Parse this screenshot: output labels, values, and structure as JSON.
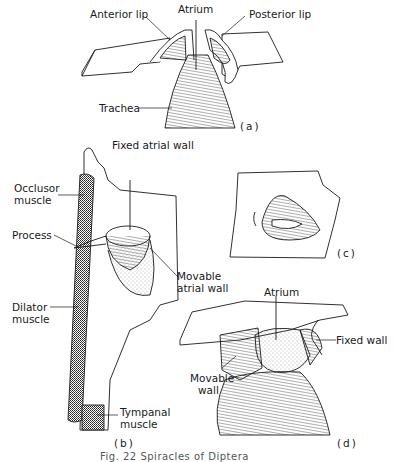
{
  "figure": {
    "caption": "Fig. 22  Spiracles of Diptera",
    "panels": [
      {
        "id": "(a)",
        "labels": [
          "Anterior lip",
          "Atrium",
          "Posterior lip",
          "Trachea"
        ]
      },
      {
        "id": "(b)",
        "labels": [
          "Fixed atrial wall",
          "Occlusor",
          "muscle",
          "Process",
          "Movable",
          "atrial wall",
          "Dilator",
          "muscle",
          "Tympanal",
          "muscle"
        ]
      },
      {
        "id": "(c)",
        "labels": []
      },
      {
        "id": "(d)",
        "labels": [
          "Atrium",
          "Fixed wall",
          "Movable",
          "wall"
        ]
      }
    ]
  }
}
